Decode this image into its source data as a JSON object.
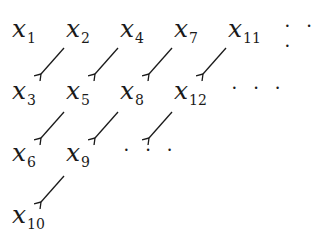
{
  "diagram": {
    "rows": [
      {
        "terms": [
          {
            "var": "x",
            "sub": "1"
          },
          {
            "var": "x",
            "sub": "2"
          },
          {
            "var": "x",
            "sub": "4"
          },
          {
            "var": "x",
            "sub": "7"
          },
          {
            "var": "x",
            "sub": "11"
          }
        ],
        "ellipsis": "· · ·"
      },
      {
        "terms": [
          {
            "var": "x",
            "sub": "3"
          },
          {
            "var": "x",
            "sub": "5"
          },
          {
            "var": "x",
            "sub": "8"
          },
          {
            "var": "x",
            "sub": "12"
          }
        ],
        "ellipsis": "· · ·"
      },
      {
        "terms": [
          {
            "var": "x",
            "sub": "6"
          },
          {
            "var": "x",
            "sub": "9"
          }
        ],
        "ellipsis": "· · ·"
      },
      {
        "terms": [
          {
            "var": "x",
            "sub": "10"
          }
        ]
      }
    ],
    "arrow_color": "#1a1a1a",
    "arrow_direction": "down-left"
  }
}
